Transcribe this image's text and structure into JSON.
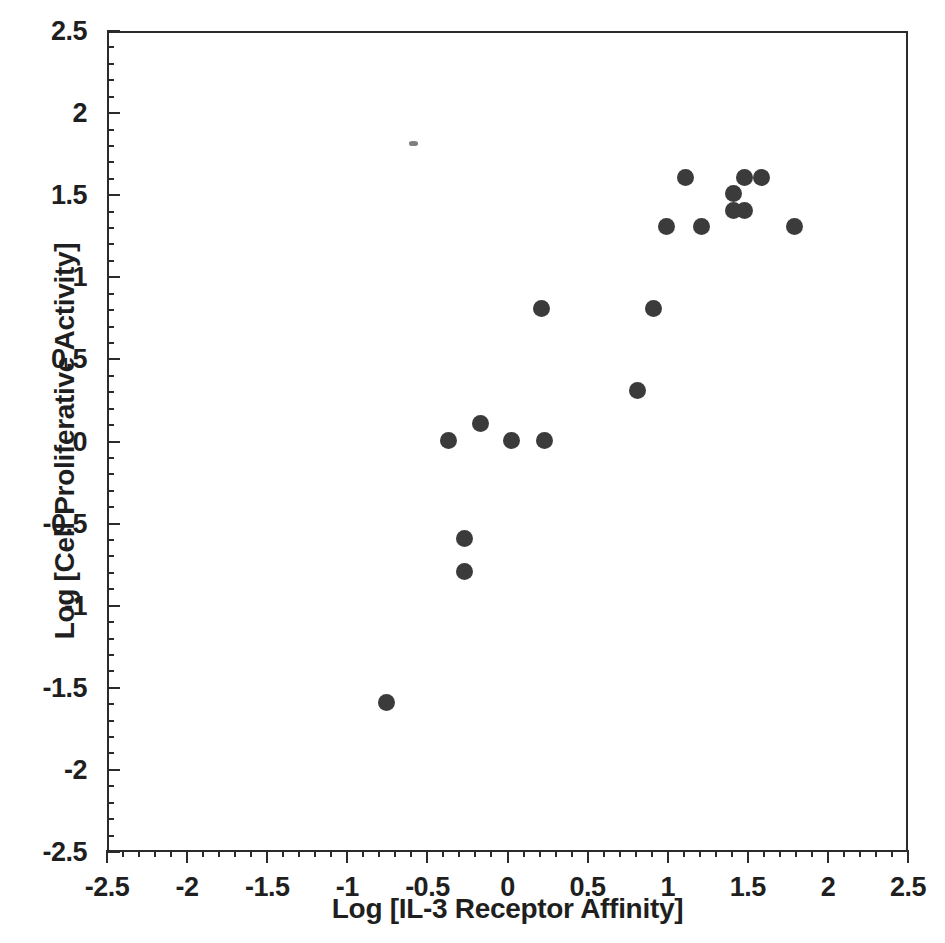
{
  "chart_data": {
    "type": "scatter",
    "title": "",
    "xlabel": "Log [IL-3 Receptor Affinity]",
    "ylabel": "Log [Cell Proliferative Activity]",
    "xlim": [
      -2.5,
      2.5
    ],
    "ylim": [
      -2.5,
      2.5
    ],
    "xticks": [
      -2.5,
      -2,
      -1.5,
      -1,
      -0.5,
      0,
      0.5,
      1,
      1.5,
      2,
      2.5
    ],
    "yticks": [
      -2.5,
      -2,
      -1.5,
      -1,
      -0.5,
      0,
      0.5,
      1,
      1.5,
      2,
      2.5
    ],
    "xtick_labels": [
      "-2.5",
      "-2",
      "-1.5",
      "-1",
      "-0.5",
      "0",
      "0.5",
      "1",
      "1.5",
      "2",
      "2.5"
    ],
    "ytick_labels": [
      "-2.5",
      "-2",
      "-1.5",
      "-1",
      "-0.5",
      "0",
      "0.5",
      "1",
      "1.5",
      "2",
      "2.5"
    ],
    "minor_tick_step": 0.1,
    "grid": false,
    "legend": null,
    "marker": {
      "shape": "circle",
      "color": "#3b3b3b",
      "size_px": 17
    },
    "series": [
      {
        "name": "IL-3 variants",
        "points": [
          {
            "x": -0.77,
            "y": -1.58
          },
          {
            "x": -0.28,
            "y": -0.78
          },
          {
            "x": -0.28,
            "y": -0.58
          },
          {
            "x": -0.38,
            "y": 0.02
          },
          {
            "x": -0.18,
            "y": 0.12
          },
          {
            "x": 0.01,
            "y": 0.02
          },
          {
            "x": 0.22,
            "y": 0.02
          },
          {
            "x": 0.2,
            "y": 0.82
          },
          {
            "x": 0.8,
            "y": 0.32
          },
          {
            "x": 0.9,
            "y": 0.82
          },
          {
            "x": 0.98,
            "y": 1.32
          },
          {
            "x": 1.1,
            "y": 1.62
          },
          {
            "x": 1.2,
            "y": 1.32
          },
          {
            "x": 1.4,
            "y": 1.52
          },
          {
            "x": 1.4,
            "y": 1.42
          },
          {
            "x": 1.47,
            "y": 1.42
          },
          {
            "x": 1.47,
            "y": 1.62
          },
          {
            "x": 1.57,
            "y": 1.62
          },
          {
            "x": 1.78,
            "y": 1.32
          }
        ]
      }
    ],
    "artifacts": [
      {
        "x": -0.6,
        "y": 1.83,
        "kind": "scan-speck"
      }
    ]
  }
}
